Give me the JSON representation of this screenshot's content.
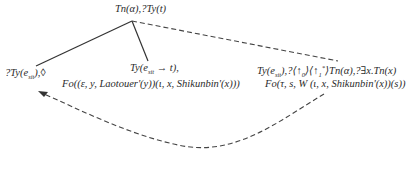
{
  "diagram": {
    "type": "semantic-tree",
    "root": {
      "label_pre": "Tn(α),?Ty(t)"
    },
    "left_node": {
      "pre": "?Ty(e",
      "sub": "sit",
      "post": "),◊"
    },
    "middle_node": {
      "line1_pre": "Ty(e",
      "line1_sub": "sit",
      "line1_post": " → t),",
      "line2": "Fo((ε, y, Laotouer'(y))(ι, x, Shikunbin'(x)))"
    },
    "right_node": {
      "line1_a": "Ty(e",
      "line1_sub1": "sit",
      "line1_b": "),?⟨↑",
      "line1_sub2": "0",
      "line1_c": "⟩⟨↑",
      "line1_sub3": "1",
      "line1_sup3": "*",
      "line1_d": "⟩Tn(α),?∃x.Tn(x)",
      "line2": "Fo(τ, s, W (ι, x, Shikunbin'(x))(s))"
    },
    "edges": [
      {
        "from": "root",
        "to": "left_node",
        "style": "solid"
      },
      {
        "from": "root",
        "to": "middle_node",
        "style": "solid"
      },
      {
        "from": "root",
        "to": "right_node",
        "style": "dashed"
      },
      {
        "from": "right_node",
        "to": "left_node",
        "style": "dashed-curved-arrow"
      }
    ]
  }
}
